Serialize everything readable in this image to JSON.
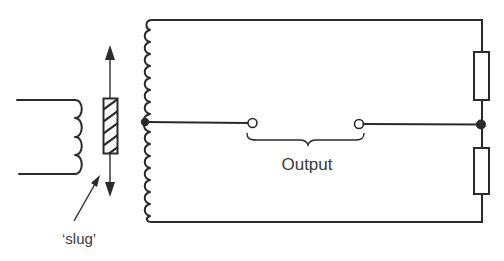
{
  "diagram": {
    "type": "circuit-schematic",
    "labels": {
      "output": "Output",
      "slug": "‘slug’"
    },
    "components": [
      {
        "id": "primary-coil",
        "kind": "inductor",
        "turns": 4
      },
      {
        "id": "slug",
        "kind": "movable-core",
        "motion": "vertical (double-headed arrow)"
      },
      {
        "id": "secondary-coil",
        "kind": "centre-tapped inductor",
        "turns_upper": 6,
        "turns_lower": 6
      },
      {
        "id": "resistor-top",
        "kind": "resistor"
      },
      {
        "id": "resistor-bottom",
        "kind": "resistor"
      },
      {
        "id": "output-terminal-left",
        "kind": "terminal"
      },
      {
        "id": "output-terminal-right",
        "kind": "terminal"
      }
    ],
    "nodes": [
      {
        "id": "centre-tap",
        "kind": "junction-dot"
      },
      {
        "id": "resistor-junction",
        "kind": "junction-dot"
      }
    ],
    "colors": {
      "ink": "#2a2a2a",
      "background": "#ffffff"
    }
  }
}
